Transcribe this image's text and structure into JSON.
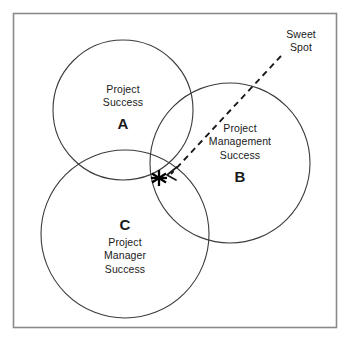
{
  "diagram": {
    "type": "venn-three-circle",
    "title_visible": false,
    "background_color": "#ffffff",
    "frame": {
      "name": "outer-border",
      "color": "#8a8a8a",
      "x": 13,
      "y": 13,
      "width": 324,
      "height": 315
    },
    "circles": [
      {
        "id": "A",
        "key": "A",
        "label": "Project\nSuccess",
        "cx": 123,
        "cy": 110,
        "r": 70,
        "stroke": "#3c3c3c"
      },
      {
        "id": "B",
        "key": "B",
        "label": "Project\nManagement\nSuccess",
        "cx": 230,
        "cy": 163,
        "r": 80,
        "stroke": "#3c3c3c"
      },
      {
        "id": "C",
        "key": "C",
        "label": "Project\nManager\nSuccess",
        "cx": 125,
        "cy": 234,
        "r": 84,
        "stroke": "#3c3c3c"
      }
    ],
    "callout": {
      "label": "Sweet\nSpot",
      "line_style": "dashed",
      "line_color": "#1a1a1a",
      "from_x": 281,
      "from_y": 56,
      "to_x": 170,
      "to_y": 174
    },
    "marker": {
      "name": "sweet-spot-star",
      "symbol": "asterisk",
      "cx": 159,
      "cy": 178,
      "color": "#000000"
    }
  }
}
